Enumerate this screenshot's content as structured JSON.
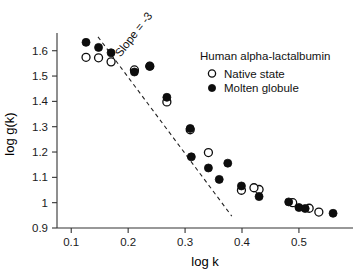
{
  "chart_data": {
    "type": "scatter",
    "title": "",
    "xlabel": "log k",
    "ylabel": "log g(k)",
    "xlim": [
      0.075,
      0.595
    ],
    "ylim": [
      0.9,
      1.67
    ],
    "grid": false,
    "xticks": [
      0.1,
      0.2,
      0.3,
      0.4,
      0.5
    ],
    "xtick_labels": [
      "0.1",
      "0.2",
      "0.3",
      "0.4",
      "0.5"
    ],
    "yticks": [
      0.9,
      1.0,
      1.1,
      1.2,
      1.3,
      1.4,
      1.5,
      1.6
    ],
    "ytick_labels": [
      "0.9",
      "1",
      "1.1",
      "1.2",
      "1.3",
      "1.4",
      "1.5",
      "1.6"
    ],
    "legend_position": "upper-right",
    "legend_title": "Human alpha-lactalbumin",
    "annotations": [
      {
        "text": "Slope = -3",
        "x": 0.215,
        "y": 1.655,
        "rotation": -52
      }
    ],
    "reference_line": {
      "label": "Slope = -3",
      "slope": -3,
      "x_start": 0.147,
      "y_start": 1.655,
      "x_end": 0.382,
      "y_end": 0.947,
      "style": "dashed"
    },
    "series": [
      {
        "name": "Native state",
        "marker": "open-circle",
        "color": "#0d0d0d",
        "points": [
          {
            "x": 0.126,
            "y": 1.574
          },
          {
            "x": 0.148,
            "y": 1.572
          },
          {
            "x": 0.17,
            "y": 1.556
          },
          {
            "x": 0.211,
            "y": 1.524
          },
          {
            "x": 0.238,
            "y": 1.539
          },
          {
            "x": 0.268,
            "y": 1.398
          },
          {
            "x": 0.309,
            "y": 1.288
          },
          {
            "x": 0.341,
            "y": 1.198
          },
          {
            "x": 0.399,
            "y": 1.049
          },
          {
            "x": 0.43,
            "y": 1.052
          },
          {
            "x": 0.421,
            "y": 1.059
          },
          {
            "x": 0.489,
            "y": 1.0
          },
          {
            "x": 0.518,
            "y": 0.978
          },
          {
            "x": 0.535,
            "y": 0.963
          }
        ]
      },
      {
        "name": "Molten globule",
        "marker": "filled-circle",
        "color": "#0d0d0d",
        "points": [
          {
            "x": 0.126,
            "y": 1.633
          },
          {
            "x": 0.148,
            "y": 1.613
          },
          {
            "x": 0.17,
            "y": 1.592
          },
          {
            "x": 0.211,
            "y": 1.516
          },
          {
            "x": 0.238,
            "y": 1.539
          },
          {
            "x": 0.268,
            "y": 1.416
          },
          {
            "x": 0.309,
            "y": 1.293
          },
          {
            "x": 0.311,
            "y": 1.181
          },
          {
            "x": 0.341,
            "y": 1.137
          },
          {
            "x": 0.36,
            "y": 1.092
          },
          {
            "x": 0.375,
            "y": 1.156
          },
          {
            "x": 0.399,
            "y": 1.066
          },
          {
            "x": 0.43,
            "y": 1.024
          },
          {
            "x": 0.482,
            "y": 1.003
          },
          {
            "x": 0.5,
            "y": 0.981
          },
          {
            "x": 0.511,
            "y": 0.977
          },
          {
            "x": 0.56,
            "y": 0.958
          }
        ]
      }
    ]
  },
  "legend": {
    "title": "Human alpha-lactalbumin",
    "entries": [
      {
        "label": "Native state",
        "marker": "open-circle"
      },
      {
        "label": "Molten globule",
        "marker": "filled-circle"
      }
    ]
  },
  "axes": {
    "x_title": "log k",
    "y_title": "log g(k)"
  }
}
